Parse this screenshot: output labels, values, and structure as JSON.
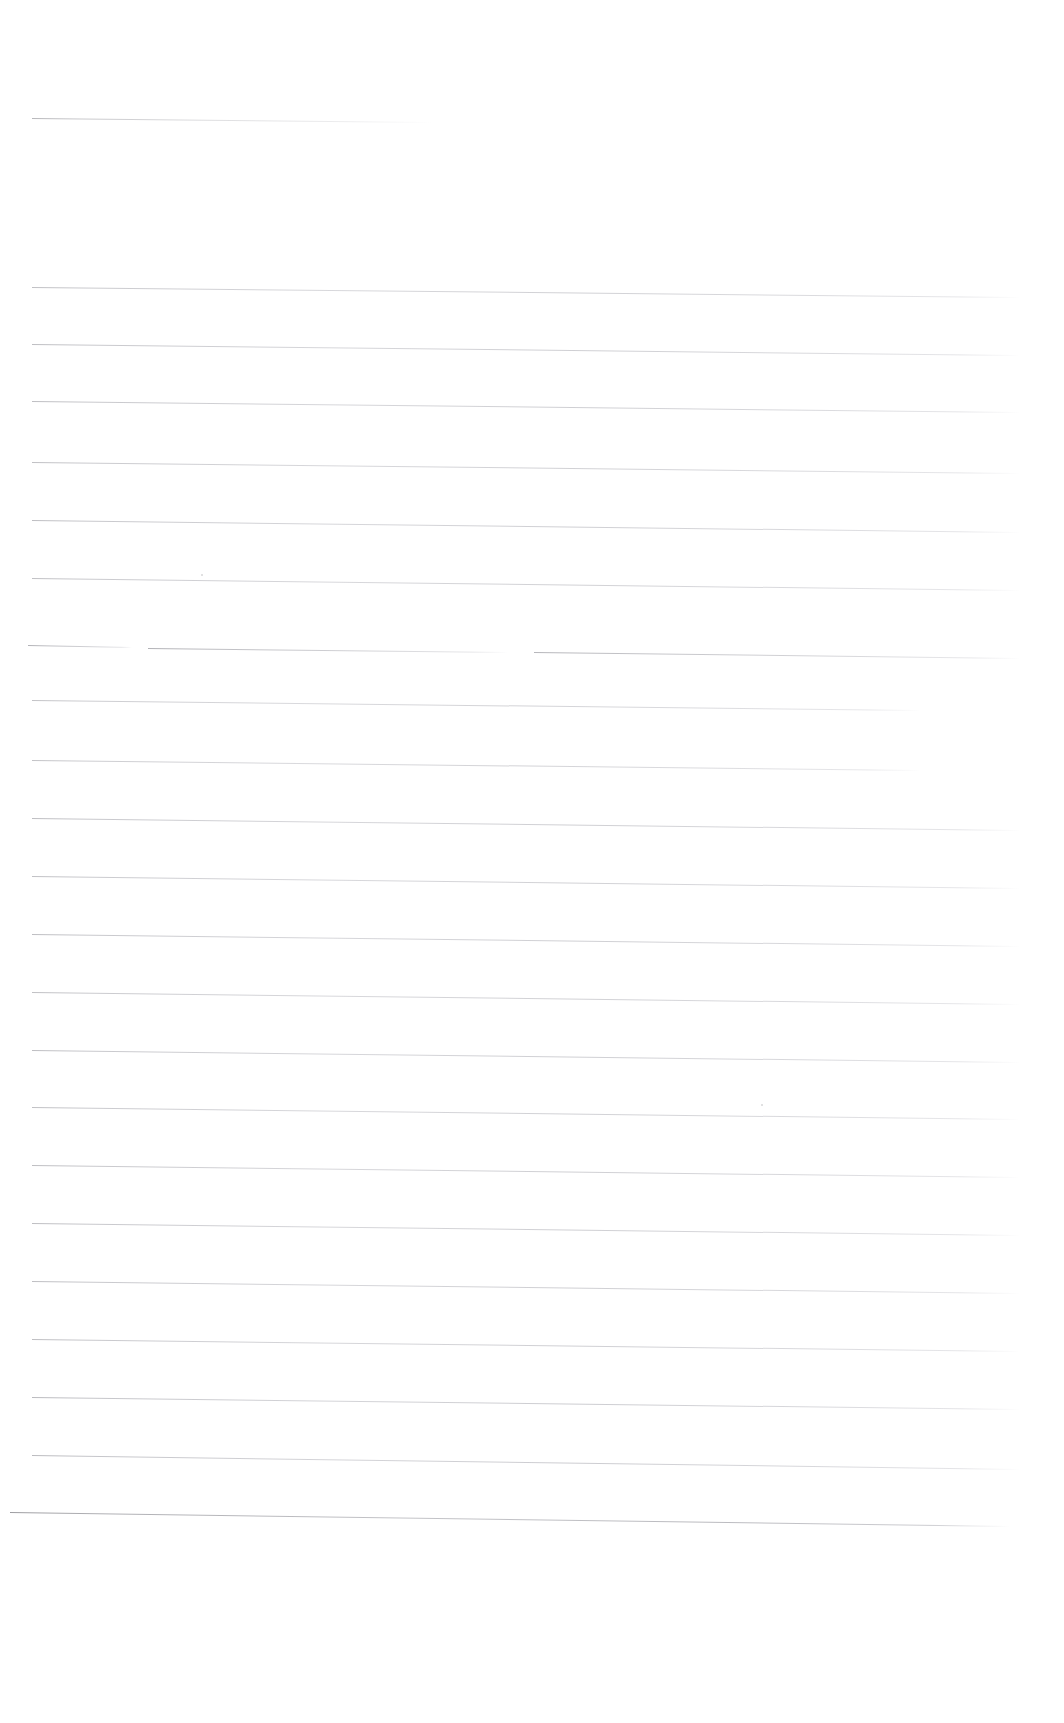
{
  "document": {
    "kind": "scanned-ruled-sheet",
    "title": "Blank ruled sheet (scan)",
    "page_width": 1064,
    "page_height": 1723,
    "background_color": "#ffffff",
    "ink_color": "#a9a9ae",
    "text_content": "",
    "visible_text": "",
    "notes": "No text, labels or numbers are rendered on this page; only faint horizontal ruling lines and two small scan specks."
  },
  "ruling": {
    "line_count": 25,
    "nominal_spacing_px": 57,
    "left_margin_px": 32,
    "right_margin_px": 1020,
    "slope_note": "lines drop slightly from left to right",
    "lines": [
      {
        "name": "rule-01",
        "x": 32,
        "y": 118,
        "width": 400,
        "slope": 4,
        "weight": 1.0,
        "opacity": 0.55,
        "style": "short"
      },
      {
        "name": "rule-02",
        "x": 32,
        "y": 287,
        "width": 988,
        "slope": 10,
        "weight": 1.0,
        "opacity": 0.5,
        "style": "full"
      },
      {
        "name": "rule-03",
        "x": 32,
        "y": 344,
        "width": 988,
        "slope": 11,
        "weight": 1.0,
        "opacity": 0.52,
        "style": "full"
      },
      {
        "name": "rule-04",
        "x": 32,
        "y": 401,
        "width": 988,
        "slope": 11,
        "weight": 1.0,
        "opacity": 0.52,
        "style": "full"
      },
      {
        "name": "rule-05",
        "x": 32,
        "y": 462,
        "width": 988,
        "slope": 11,
        "weight": 1.0,
        "opacity": 0.5,
        "style": "full"
      },
      {
        "name": "rule-06",
        "x": 32,
        "y": 520,
        "width": 988,
        "slope": 12,
        "weight": 1.0,
        "opacity": 0.52,
        "style": "full"
      },
      {
        "name": "rule-07",
        "x": 32,
        "y": 578,
        "width": 988,
        "slope": 12,
        "weight": 1.0,
        "opacity": 0.5,
        "style": "full"
      },
      {
        "name": "rule-08",
        "x": 28,
        "y": 645,
        "width": 104,
        "slope": 2,
        "weight": 1.0,
        "opacity": 0.55,
        "style": "segment"
      },
      {
        "name": "rule-09",
        "x": 148,
        "y": 648,
        "width": 360,
        "slope": 4,
        "weight": 1.0,
        "opacity": 0.55,
        "style": "segment"
      },
      {
        "name": "rule-10",
        "x": 534,
        "y": 652,
        "width": 486,
        "slope": 6,
        "weight": 1.0,
        "opacity": 0.52,
        "style": "segment"
      },
      {
        "name": "rule-11",
        "x": 32,
        "y": 700,
        "width": 888,
        "slope": 10,
        "weight": 1.0,
        "opacity": 0.48,
        "style": "full"
      },
      {
        "name": "rule-12",
        "x": 32,
        "y": 760,
        "width": 888,
        "slope": 10,
        "weight": 1.0,
        "opacity": 0.48,
        "style": "full"
      },
      {
        "name": "rule-13",
        "x": 32,
        "y": 818,
        "width": 988,
        "slope": 12,
        "weight": 1.0,
        "opacity": 0.52,
        "style": "full"
      },
      {
        "name": "rule-14",
        "x": 32,
        "y": 876,
        "width": 988,
        "slope": 12,
        "weight": 1.0,
        "opacity": 0.5,
        "style": "full"
      },
      {
        "name": "rule-15",
        "x": 32,
        "y": 934,
        "width": 988,
        "slope": 12,
        "weight": 1.0,
        "opacity": 0.52,
        "style": "full"
      },
      {
        "name": "rule-16",
        "x": 32,
        "y": 992,
        "width": 988,
        "slope": 12,
        "weight": 1.0,
        "opacity": 0.5,
        "style": "full"
      },
      {
        "name": "rule-17",
        "x": 32,
        "y": 1050,
        "width": 988,
        "slope": 12,
        "weight": 1.0,
        "opacity": 0.52,
        "style": "full"
      },
      {
        "name": "rule-18",
        "x": 32,
        "y": 1107,
        "width": 988,
        "slope": 12,
        "weight": 1.0,
        "opacity": 0.5,
        "style": "full"
      },
      {
        "name": "rule-19",
        "x": 32,
        "y": 1165,
        "width": 988,
        "slope": 12,
        "weight": 1.0,
        "opacity": 0.52,
        "style": "full"
      },
      {
        "name": "rule-20",
        "x": 32,
        "y": 1223,
        "width": 988,
        "slope": 12,
        "weight": 1.0,
        "opacity": 0.52,
        "style": "full"
      },
      {
        "name": "rule-21",
        "x": 32,
        "y": 1281,
        "width": 988,
        "slope": 12,
        "weight": 1.0,
        "opacity": 0.52,
        "style": "full"
      },
      {
        "name": "rule-22",
        "x": 32,
        "y": 1339,
        "width": 988,
        "slope": 12,
        "weight": 1.0,
        "opacity": 0.52,
        "style": "full"
      },
      {
        "name": "rule-23",
        "x": 32,
        "y": 1397,
        "width": 988,
        "slope": 12,
        "weight": 1.0,
        "opacity": 0.55,
        "style": "full"
      },
      {
        "name": "rule-24",
        "x": 32,
        "y": 1455,
        "width": 988,
        "slope": 14,
        "weight": 1.0,
        "opacity": 0.55,
        "style": "full"
      },
      {
        "name": "rule-25",
        "x": 10,
        "y": 1512,
        "width": 1000,
        "slope": 14,
        "weight": 1.0,
        "opacity": 0.62,
        "style": "full-bleed"
      }
    ]
  },
  "artifacts": {
    "specks": [
      {
        "name": "scan-speck-left",
        "x": 201,
        "y": 574,
        "size": 2
      },
      {
        "name": "scan-speck-right",
        "x": 761,
        "y": 1104,
        "size": 2
      }
    ]
  }
}
